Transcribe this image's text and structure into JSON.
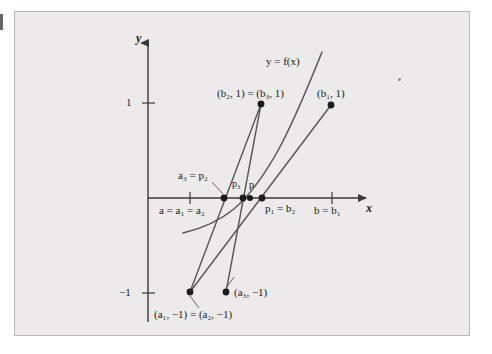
{
  "figure": {
    "kind": "math-diagram",
    "panel_bg": "#eceaea",
    "panel_border": "#b9b7b7",
    "page_bg": "#ffffff",
    "ink": "#1b1b1b",
    "curve_color": "#555555",
    "axis_color": "#3a3a3a"
  },
  "axes": {
    "x_label": "x",
    "y_label": "y",
    "y_ticks": [
      {
        "value": 1,
        "label": "1",
        "px_y": 103
      },
      {
        "value": -1,
        "label": "−1",
        "px_y": 293
      }
    ],
    "x_ticks": [
      {
        "label": "a = a₁ = a₂",
        "px_x": 190
      },
      {
        "label": "b = b₁",
        "px_x": 332
      }
    ],
    "origin_px": {
      "x": 148,
      "y": 198
    }
  },
  "curve": {
    "label": "y = f(x)",
    "label_pos": {
      "x": 266,
      "y": 62
    }
  },
  "labels": {
    "b2b3": "(b₂, 1) = (b₃, 1)",
    "b1": "(b₁, 1)",
    "a3_p2": "a₃ = p₂",
    "p3": "p₃",
    "p": "p",
    "p1_b2": "p₁ = b₂",
    "a_chain": "a = a₁ = a₂",
    "b_chain": "b = b₁",
    "a1a2_neg1": "(a₁, −1) = (a₂, −1)",
    "a3_neg1": "(a₃, −1)",
    "tick_one": "1",
    "tick_neg_one": "−1",
    "x_axis": "x",
    "y_axis": "y"
  },
  "points": [
    {
      "name": "(b2,1)=(b3,1)",
      "px": {
        "x": 261,
        "y": 104
      }
    },
    {
      "name": "(b1,1)",
      "px": {
        "x": 331,
        "y": 105
      }
    },
    {
      "name": "a3 = p2",
      "px": {
        "x": 224,
        "y": 198
      }
    },
    {
      "name": "p3",
      "px": {
        "x": 243,
        "y": 198
      }
    },
    {
      "name": "p",
      "px": {
        "x": 250,
        "y": 198
      }
    },
    {
      "name": "p1 = b2",
      "px": {
        "x": 262,
        "y": 198
      }
    },
    {
      "name": "(a1,-1)=(a2,-1)",
      "px": {
        "x": 190,
        "y": 292
      }
    },
    {
      "name": "(a3,-1)",
      "px": {
        "x": 226,
        "y": 292
      }
    }
  ],
  "secant_lines": [
    {
      "name": "secant-1",
      "from": {
        "x": 190,
        "y": 292
      },
      "to": {
        "x": 331,
        "y": 105
      }
    },
    {
      "name": "secant-2",
      "from": {
        "x": 190,
        "y": 292
      },
      "to": {
        "x": 261,
        "y": 104
      }
    },
    {
      "name": "secant-3",
      "from": {
        "x": 226,
        "y": 292
      },
      "to": {
        "x": 261,
        "y": 104
      }
    }
  ]
}
